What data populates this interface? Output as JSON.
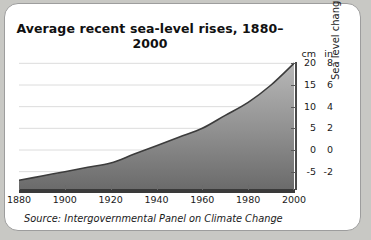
{
  "card": {
    "title": "Average recent sea-level rises, 1880–2000",
    "source": "Source: Intergovernmental Panel on Climate Change"
  },
  "axis": {
    "unit_primary_header": "cm",
    "unit_secondary_header": "in",
    "vertical_title": "Sea level change"
  },
  "colors": {
    "card_background": "#ffffff",
    "page_background": "#c8c8c4",
    "border": "#9d9d9d",
    "axis": "#3a3a3a",
    "gridline": "#dcdcdc",
    "curve_line": "#3c3c3c",
    "fill_top": "#b4b4b4",
    "fill_bottom": "#6e6e6e"
  },
  "chart_data": {
    "type": "area",
    "title": "Average recent sea-level rises, 1880–2000",
    "xlabel": "",
    "ylabel": "Sea level change",
    "grid": true,
    "legend": null,
    "xlim": [
      1880,
      2000
    ],
    "ylim": [
      -9,
      21
    ],
    "xticks": [
      1880,
      1900,
      1920,
      1940,
      1960,
      1980,
      2000
    ],
    "xtick_labels": [
      "1880",
      "1900",
      "1920",
      "1940",
      "1960",
      "1980",
      "2000"
    ],
    "yticks_cm": [
      20,
      15,
      10,
      5,
      0,
      -5
    ],
    "ytick_labels_cm": [
      "20",
      "15",
      "10",
      "5",
      "0",
      "-5"
    ],
    "yticks_in": [
      8,
      6,
      4,
      2,
      0,
      -2
    ],
    "ytick_labels_in": [
      "8",
      "6",
      "4",
      "2",
      "0",
      "-2"
    ],
    "y_units": [
      "cm",
      "in"
    ],
    "x": [
      1880,
      1890,
      1900,
      1910,
      1920,
      1930,
      1940,
      1950,
      1960,
      1970,
      1980,
      1990,
      2000
    ],
    "values_cm": [
      -7.0,
      -6.0,
      -5.0,
      -4.0,
      -3.0,
      -1.0,
      1.0,
      3.0,
      5.0,
      8.0,
      11.0,
      15.0,
      20.0
    ],
    "series": [
      {
        "name": "Sea level change",
        "unit": "cm",
        "values": [
          -7.0,
          -6.0,
          -5.0,
          -4.0,
          -3.0,
          -1.0,
          1.0,
          3.0,
          5.0,
          8.0,
          11.0,
          15.0,
          20.0
        ]
      }
    ]
  }
}
